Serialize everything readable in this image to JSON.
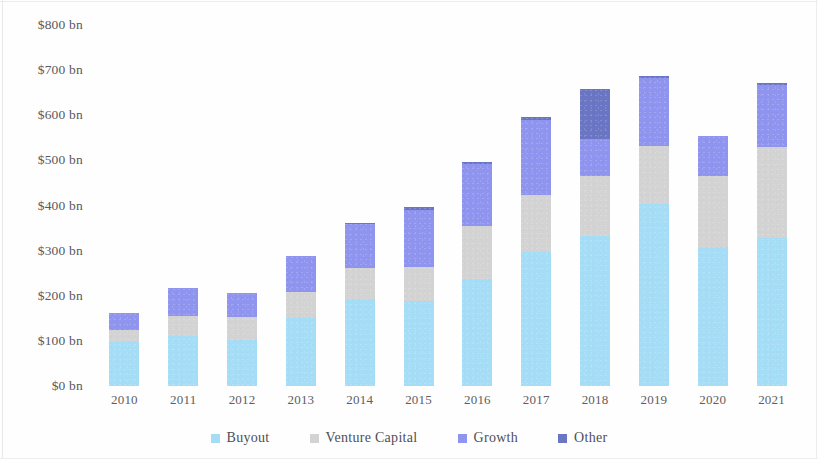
{
  "chart_data": {
    "type": "bar",
    "stacked": true,
    "title": "",
    "subtitle": "",
    "xlabel": "",
    "ylabel": "",
    "grid": false,
    "legend_position": "bottom",
    "categories": [
      "2010",
      "2011",
      "2012",
      "2013",
      "2014",
      "2015",
      "2016",
      "2017",
      "2018",
      "2019",
      "2020",
      "2021"
    ],
    "ylim": [
      0,
      800
    ],
    "ytick_values": [
      0,
      100,
      200,
      300,
      400,
      500,
      600,
      700,
      800
    ],
    "ytick_labels": [
      "$0 bn",
      "$100 bn",
      "$200 bn",
      "$300 bn",
      "$400 bn",
      "$500 bn",
      "$600 bn",
      "$700 bn",
      "$800 bn"
    ],
    "series": [
      {
        "name": "Buyout",
        "color": "#a5ddf7",
        "values": [
          98,
          110,
          102,
          152,
          193,
          188,
          237,
          297,
          333,
          404,
          308,
          328
        ]
      },
      {
        "name": "Venture Capital",
        "color": "#d4d3d3",
        "values": [
          26,
          45,
          51,
          57,
          69,
          75,
          118,
          126,
          133,
          128,
          158,
          202
        ]
      },
      {
        "name": "Growth",
        "color": "#8f94ef",
        "values": [
          38,
          62,
          53,
          79,
          96,
          126,
          137,
          166,
          82,
          151,
          88,
          138
        ]
      },
      {
        "name": "Other",
        "color": "#6a76c4",
        "values": [
          0,
          0,
          0,
          0,
          4,
          8,
          5,
          7,
          111,
          4,
          0,
          4
        ]
      }
    ],
    "totals": [
      162,
      217,
      206,
      288,
      362,
      397,
      497,
      596,
      659,
      687,
      554,
      672
    ]
  },
  "legend": {
    "items": [
      {
        "label": "Buyout"
      },
      {
        "label": "Venture Capital"
      },
      {
        "label": "Growth"
      },
      {
        "label": "Other"
      }
    ]
  }
}
